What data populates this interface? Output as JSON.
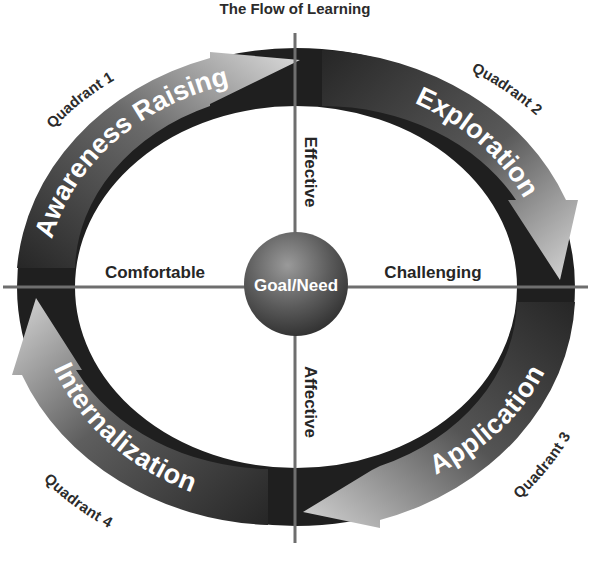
{
  "title": "The Flow of Learning",
  "center": {
    "label": "Goal/Need"
  },
  "axes": {
    "top": "Effective",
    "bottom": "Affective",
    "left": "Comfortable",
    "right": "Challenging"
  },
  "quadrants": [
    {
      "label": "Quadrant 1",
      "stage": "Awareness Raising"
    },
    {
      "label": "Quadrant 2",
      "stage": "Exploration"
    },
    {
      "label": "Quadrant 3",
      "stage": "Application"
    },
    {
      "label": "Quadrant 4",
      "stage": "Internalization"
    }
  ],
  "colors": {
    "ring": "#1f1f1f",
    "arrow_light": "#d6d6d6",
    "arrow_dark": "#2a2a2a",
    "axis_line": "#6e6e6e",
    "sphere_light": "#8a8a8a",
    "sphere_dark": "#2e2e2e"
  }
}
